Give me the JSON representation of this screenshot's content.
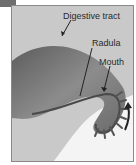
{
  "figure": {
    "tab_color": "#6e6e6e",
    "background_color": "#c9c9c9",
    "body_color": "#7a7a7a",
    "labels": [
      {
        "id": "digestive-tract",
        "text": "Digestive tract"
      },
      {
        "id": "radula",
        "text": "Radula"
      },
      {
        "id": "mouth",
        "text": "Mouth"
      }
    ],
    "arrow": {
      "direction": "up",
      "meaning": "radula-movement"
    }
  }
}
